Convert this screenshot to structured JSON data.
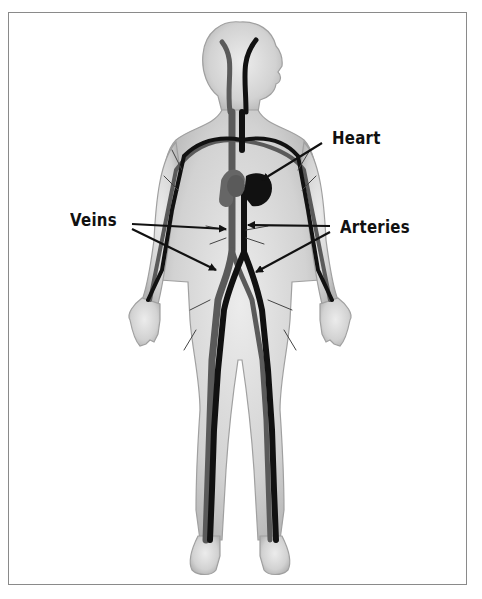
{
  "diagram": {
    "labels": {
      "heart": "Heart",
      "veins": "Veins",
      "arteries": "Arteries"
    },
    "colors": {
      "body_fill": "#d4d4d4",
      "body_edge": "#a8a8a8",
      "artery": "#111111",
      "vein": "#555555",
      "frame": "#8a8a8a",
      "label_text": "#111111"
    },
    "annotations": [
      {
        "label": "Heart",
        "points_to": "heart",
        "arrow_count": 1
      },
      {
        "label": "Veins",
        "points_to": "vena cava / iliac veins",
        "arrow_count": 2
      },
      {
        "label": "Arteries",
        "points_to": "aorta / iliac arteries",
        "arrow_count": 2
      }
    ]
  }
}
